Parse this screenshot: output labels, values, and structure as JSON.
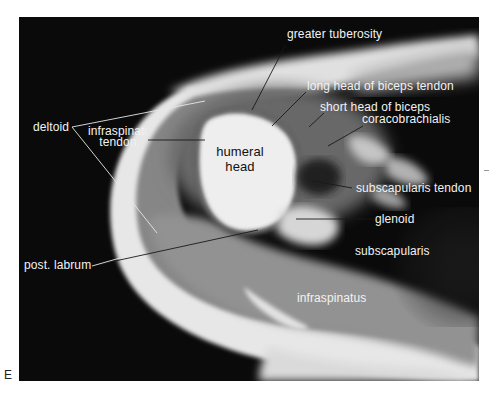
{
  "figure": {
    "panel_letter": "E",
    "type": "axial MRI of shoulder, labeled",
    "colors": {
      "background": "#0b0b0b",
      "label_text_light": "#f2f2f2",
      "label_text_dark": "#111111",
      "leader_line_light": "#e8e8e8",
      "leader_line_dark": "#1a1a1a"
    }
  },
  "labels": {
    "greater_tuberosity": "greater tuberosity",
    "long_head_biceps": "long head of biceps tendon",
    "short_head_biceps": "short head of biceps",
    "coracobrachialis": "coracobrachialis",
    "deltoid": "deltoid",
    "infraspinatus_tendon_line1": "infraspinatus",
    "infraspinatus_tendon_line2": "tendon",
    "humeral_head_line1": "humeral",
    "humeral_head_line2": "head",
    "subscapularis_tendon": "subscapularis tendon",
    "glenoid": "glenoid",
    "subscapularis": "subscapularis",
    "post_labrum": "post. labrum",
    "infraspinatus": "infraspinatus"
  }
}
